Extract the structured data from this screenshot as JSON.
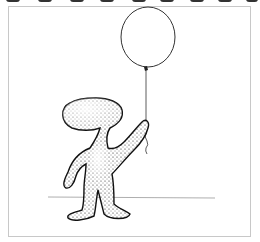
{
  "illustration": {
    "subject": "stippled figure holding a balloon",
    "elements": [
      "balloon",
      "balloon-string",
      "figure",
      "ground-line",
      "frame"
    ],
    "colors": {
      "ink": "#1a1a1a",
      "frame": "#c8c8c8",
      "background": "#ffffff"
    }
  }
}
